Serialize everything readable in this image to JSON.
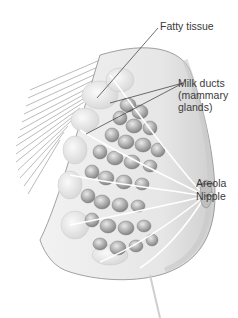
{
  "diagram": {
    "labels": [
      {
        "id": "fatty-tissue",
        "text": "Fatty tissue"
      },
      {
        "id": "milk-ducts",
        "text": "Milk ducts\n(mammary\nglands)"
      },
      {
        "id": "areola",
        "text": "Areola"
      },
      {
        "id": "nipple",
        "text": "Nipple"
      }
    ]
  },
  "colors": {
    "background": "#ffffff",
    "label_text": "#3a3a3a",
    "leader_line": "#333333",
    "tissue_light": "#e8e8e8",
    "tissue_mid": "#bdbdbd",
    "tissue_dark": "#8a8a8a"
  }
}
